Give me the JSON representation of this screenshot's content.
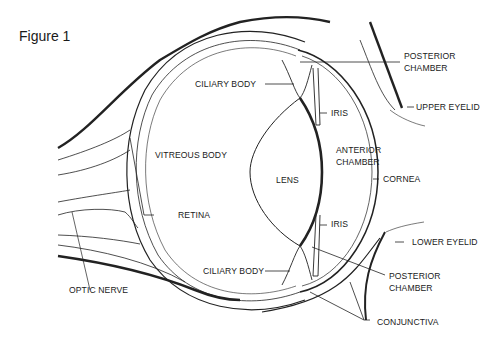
{
  "figure": {
    "title": "Figure 1"
  },
  "labels": {
    "posterior_chamber_top": [
      "POSTERIOR",
      "CHAMBER"
    ],
    "ciliary_body_top": "CILIARY BODY",
    "iris_top": "IRIS",
    "upper_eyelid": "UPPER EYELID",
    "anterior_chamber": [
      "ANTERIOR",
      "CHAMBER"
    ],
    "vitreous_body": "VITREOUS BODY",
    "lens": "LENS",
    "cornea": "CORNEA",
    "retina": "RETINA",
    "iris_bottom": "IRIS",
    "lower_eyelid": "LOWER EYELID",
    "ciliary_body_bottom": "CILIARY BODY",
    "posterior_chamber_bottom": [
      "POSTERIOR",
      "CHAMBER"
    ],
    "optic_nerve": "OPTIC NERVE",
    "conjunctiva": "CONJUNCTIVA"
  }
}
